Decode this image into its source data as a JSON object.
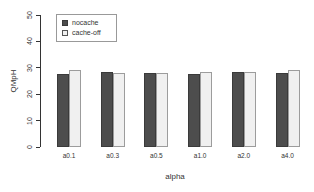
{
  "canvas": {
    "width": 314,
    "height": 192,
    "background": "#ffffff"
  },
  "chart_data": {
    "type": "bar",
    "title": "",
    "categories": [
      "a0.1",
      "a0.3",
      "a0.5",
      "a1.0",
      "a2.0",
      "a4.0"
    ],
    "series": [
      {
        "name": "nocache",
        "color": "#4d4d4d",
        "border": "#3a3a3a",
        "values": [
          27.5,
          28.5,
          28,
          27.5,
          28.5,
          28
        ]
      },
      {
        "name": "cache-off",
        "color": "#f0f0f0",
        "border": "#9c9c9c",
        "values": [
          29,
          28,
          28,
          28.5,
          28.5,
          29
        ]
      }
    ],
    "xlabel": "alpha",
    "ylabel": "QMpH",
    "ylim": [
      0,
      50
    ],
    "yticks": [
      0,
      10,
      20,
      30,
      40,
      50
    ],
    "legend_position": "top-left",
    "grid": false,
    "axis_color": "#333333",
    "text_color": "#333333"
  }
}
